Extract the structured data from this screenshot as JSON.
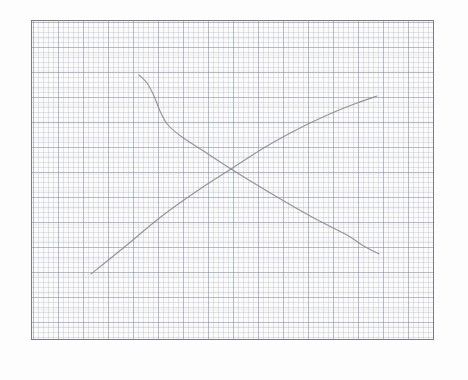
{
  "sheet": {
    "kind": "graph-paper-photo",
    "background_color": "#fdfdfd",
    "width": 468,
    "height": 380
  },
  "plot_frame": {
    "border_color": "#7b7b80",
    "fill_color": "#fbfbfc",
    "left": 31,
    "top": 20,
    "width": 403,
    "height": 320
  },
  "grid": {
    "minor_spacing_px": 5,
    "major_spacing_px": 25,
    "minor_color": "#969eaa",
    "major_color": "#7e8694",
    "visible": true
  },
  "chart_data": {
    "type": "line",
    "title": "",
    "subtitle": "",
    "xlabel": "",
    "ylabel": "",
    "grid": true,
    "legend_position": "none",
    "axis_ticks_labeled": false,
    "xlim": [
      0,
      403
    ],
    "ylim": [
      0,
      320
    ],
    "note": "Hand-drawn pencil sketch on graph paper: two crossing curves forming an X, read in plot-frame pixel coordinates with y measured downward from the frame top.",
    "intersection": {
      "x": 199,
      "y": 148
    },
    "series": [
      {
        "name": "downward-sloping-curve",
        "stroke_color": "#8a8a8e",
        "stroke_width": 1.15,
        "shape": "convex-decreasing",
        "points": [
          {
            "x": 107,
            "y": 54
          },
          {
            "x": 115,
            "y": 62
          },
          {
            "x": 122,
            "y": 75
          },
          {
            "x": 128,
            "y": 90
          },
          {
            "x": 136,
            "y": 104
          },
          {
            "x": 150,
            "y": 116
          },
          {
            "x": 170,
            "y": 129
          },
          {
            "x": 199,
            "y": 148
          },
          {
            "x": 240,
            "y": 173
          },
          {
            "x": 280,
            "y": 196
          },
          {
            "x": 315,
            "y": 214
          },
          {
            "x": 330,
            "y": 224
          },
          {
            "x": 347,
            "y": 233
          }
        ]
      },
      {
        "name": "upward-sloping-curve",
        "stroke_color": "#8a8a8e",
        "stroke_width": 1.15,
        "shape": "slightly-concave-increasing",
        "points": [
          {
            "x": 59,
            "y": 253
          },
          {
            "x": 90,
            "y": 228
          },
          {
            "x": 130,
            "y": 195
          },
          {
            "x": 165,
            "y": 170
          },
          {
            "x": 199,
            "y": 148
          },
          {
            "x": 235,
            "y": 125
          },
          {
            "x": 270,
            "y": 106
          },
          {
            "x": 300,
            "y": 92
          },
          {
            "x": 325,
            "y": 82
          },
          {
            "x": 345,
            "y": 75
          }
        ]
      }
    ]
  }
}
